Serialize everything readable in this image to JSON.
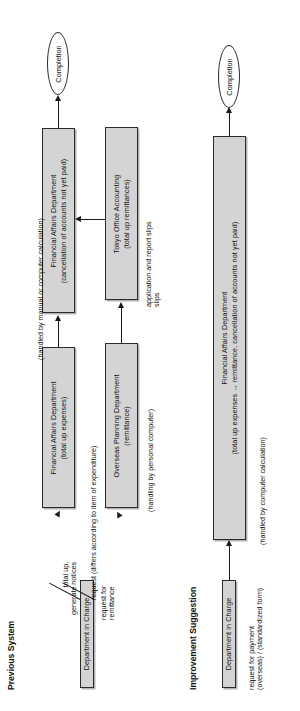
{
  "document": {
    "orientation": "rotated-90-ccw",
    "page_background": "#ffffff",
    "box_fill": "#d4d4d4",
    "stroke": "#1a1a1a"
  },
  "sections": [
    {
      "id": "previous",
      "title": "Previous System"
    },
    {
      "id": "improvement",
      "title": "Improvement Suggestion"
    }
  ],
  "previous_system": {
    "start_node": {
      "label": "Department in Charge"
    },
    "end_node": {
      "label": "Completion"
    },
    "boxes": [
      {
        "id": "fa-total-up",
        "line1": "Financial Affairs Department",
        "line2": "(total up expenses)"
      },
      {
        "id": "overseas-planning",
        "line1": "Overseas Planning Department",
        "line2": "(remittance)"
      },
      {
        "id": "fa-cancellation",
        "line1": "Financial Affairs Department",
        "line2": "(cancellation of accounts not yet paid)"
      },
      {
        "id": "tokyo-office",
        "line1": "Tokyo Office Accounting",
        "line2": "(total up remittances)"
      }
    ],
    "annotations": [
      {
        "id": "note-total-up",
        "line1": "total up,",
        "line2": "generate notices"
      },
      {
        "id": "note-request-remit",
        "line1": "request for",
        "line2": "remittance"
      },
      {
        "id": "note-request-item",
        "line1": "request (differs according to item of expenditure)",
        "line2": ""
      },
      {
        "id": "note-manual-or-comp",
        "line1": "(handled by manual or computer calculation)",
        "line2": ""
      },
      {
        "id": "note-personal-comp",
        "line1": "(handling by personal computer)",
        "line2": ""
      },
      {
        "id": "note-app-report",
        "line1": "application and report slips",
        "line2": "slips"
      }
    ]
  },
  "improvement_suggestion": {
    "start_node": {
      "label": "Department in Charge"
    },
    "end_node": {
      "label": "Completion"
    },
    "boxes": [
      {
        "id": "fa-combined",
        "line1": "Financial Affairs Department",
        "line2": "(total up expenses → remittance, cancellation of accounts not yet paid)"
      }
    ],
    "annotations": [
      {
        "id": "note-request-payment",
        "line1": "request for payment",
        "line2": "(overseas) / (standardized form)"
      },
      {
        "id": "note-computer-calc",
        "line1": "(handled by computer calculation)",
        "line2": ""
      }
    ]
  }
}
